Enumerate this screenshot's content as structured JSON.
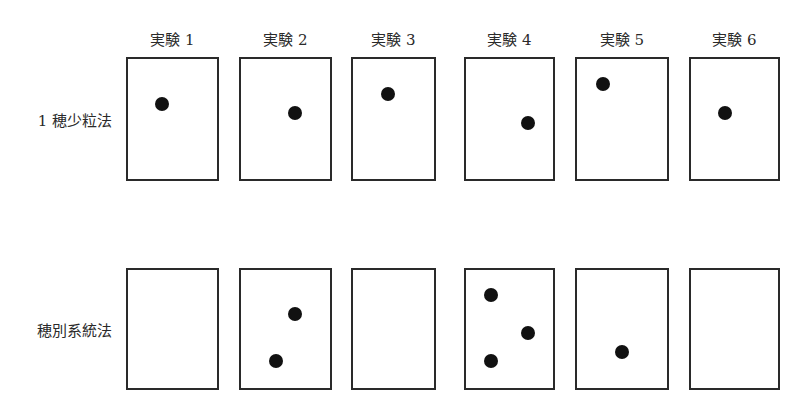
{
  "diagram": {
    "columns": [
      "実験 1",
      "実験 2",
      "実験 3",
      "実験 4",
      "実験 5",
      "実験 6"
    ],
    "rows": [
      {
        "label": "1 穂少粒法",
        "boxes": [
          {
            "dots": [
              [
                0.39,
                0.38
              ]
            ]
          },
          {
            "dots": [
              [
                0.6,
                0.45
              ]
            ]
          },
          {
            "dots": [
              [
                0.43,
                0.3
              ]
            ]
          },
          {
            "dots": [
              [
                0.7,
                0.53
              ]
            ]
          },
          {
            "dots": [
              [
                0.3,
                0.22
              ]
            ]
          },
          {
            "dots": [
              [
                0.4,
                0.45
              ]
            ]
          }
        ]
      },
      {
        "label": "穂別系統法",
        "boxes": [
          {
            "dots": []
          },
          {
            "dots": [
              [
                0.6,
                0.38
              ]
            ],
            "extra": [
              [
                0.4,
                0.76
              ]
            ]
          },
          {
            "dots": []
          },
          {
            "dots": [
              [
                0.3,
                0.22
              ],
              [
                0.7,
                0.53
              ],
              [
                0.3,
                0.76
              ]
            ]
          },
          {
            "dots": [
              [
                0.5,
                0.69
              ]
            ]
          },
          {
            "dots": []
          }
        ]
      }
    ],
    "dot_color": "#111111",
    "border_color": "#2a2a2a"
  }
}
